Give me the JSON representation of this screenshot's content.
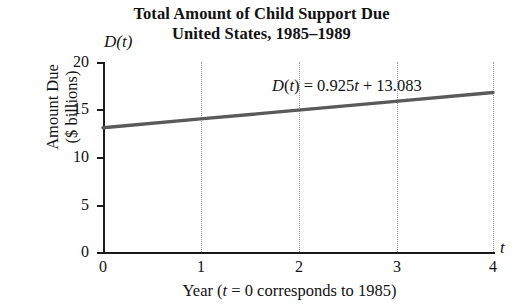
{
  "chart_data": {
    "type": "line",
    "title": "Total Amount of Child Support Due",
    "title_line2": "United States, 1985–1989",
    "xlabel": "Year (t = 0 corresponds to 1985)",
    "ylabel": "Amount Due\n($ billions)",
    "x_axis_variable": "t",
    "y_axis_variable": "D(t)",
    "annotation": "D(t) = 0.925t + 13.083",
    "equation": {
      "slope": 0.925,
      "intercept": 13.083
    },
    "x": [
      0,
      1,
      2,
      3,
      4
    ],
    "values": [
      13.083,
      14.008,
      14.933,
      15.858,
      16.783
    ],
    "xlim": [
      0,
      4
    ],
    "ylim": [
      0,
      20
    ],
    "xticks": [
      "0",
      "1",
      "2",
      "3",
      "4"
    ],
    "yticks": [
      "0",
      "5",
      "10",
      "15",
      "20"
    ],
    "grid": "vertical-dotted",
    "legend": "none",
    "line_color": "#5a5a5a",
    "axis_color": "#1a1a1a",
    "grid_color": "#9a9a9a"
  },
  "labels": {
    "ylabel_line1": "Amount Due",
    "ylabel_line2": "($ billions)",
    "xlabel_pre": "Year (",
    "xlabel_var": "t",
    "xlabel_post": " = 0 corresponds to 1985)",
    "annotation_var1": "D",
    "annotation_paren1": "(",
    "annotation_var2": "t",
    "annotation_mid": ") = 0.925",
    "annotation_var3": "t",
    "annotation_end": " + 13.083"
  }
}
